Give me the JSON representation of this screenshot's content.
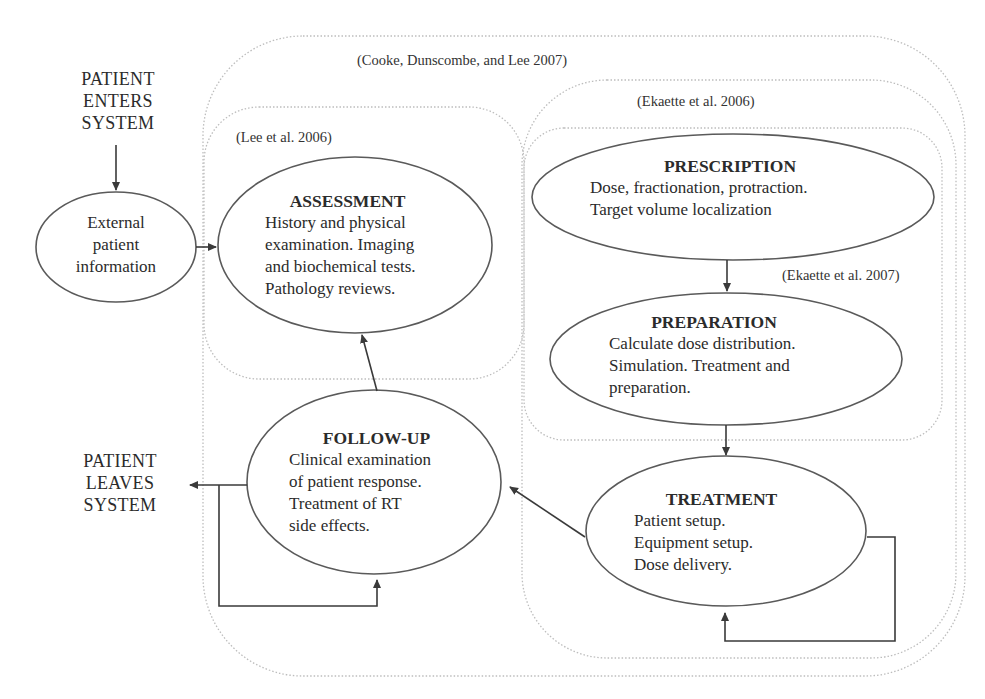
{
  "diagram": {
    "type": "process-flowchart",
    "colors": {
      "node_stroke": "#555555",
      "arrow": "#3a3a3a",
      "group_border": "#bbbbbb",
      "text": "#2b2b2b"
    },
    "terminals": {
      "enter": [
        "PATIENT",
        "ENTERS",
        "SYSTEM"
      ],
      "leave": [
        "PATIENT",
        "LEAVES",
        "SYSTEM"
      ]
    },
    "groups": [
      {
        "id": "cooke",
        "label": "(Cooke, Dunscombe, and Lee 2007)"
      },
      {
        "id": "lee",
        "label": "(Lee et al. 2006)"
      },
      {
        "id": "ekaette2006",
        "label": "(Ekaette et al. 2006)"
      },
      {
        "id": "ekaette2007",
        "label": "(Ekaette et al. 2007)"
      }
    ],
    "nodes": {
      "external": {
        "title": "",
        "lines": [
          "External",
          "patient",
          "information"
        ]
      },
      "assessment": {
        "title": "ASSESSMENT",
        "lines": [
          "History and physical",
          "examination. Imaging",
          "and biochemical tests.",
          "Pathology reviews."
        ]
      },
      "prescription": {
        "title": "PRESCRIPTION",
        "lines": [
          "Dose, fractionation, protraction.",
          "Target volume localization"
        ]
      },
      "preparation": {
        "title": "PREPARATION",
        "lines": [
          "Calculate dose distribution.",
          "Simulation. Treatment and",
          "preparation."
        ]
      },
      "treatment": {
        "title": "TREATMENT",
        "lines": [
          "Patient setup.",
          "Equipment setup.",
          "Dose delivery."
        ]
      },
      "followup": {
        "title": "FOLLOW-UP",
        "lines": [
          "Clinical examination",
          "of patient response.",
          "Treatment of RT",
          "side effects."
        ]
      }
    },
    "edges": [
      {
        "from": "enter",
        "to": "external"
      },
      {
        "from": "external",
        "to": "assessment"
      },
      {
        "from": "prescription",
        "to": "preparation"
      },
      {
        "from": "preparation",
        "to": "treatment"
      },
      {
        "from": "treatment",
        "to": "followup"
      },
      {
        "from": "treatment",
        "to": "treatment",
        "kind": "loop"
      },
      {
        "from": "followup",
        "to": "assessment"
      },
      {
        "from": "followup",
        "to": "followup",
        "kind": "loop"
      },
      {
        "from": "followup",
        "to": "leave"
      }
    ]
  }
}
